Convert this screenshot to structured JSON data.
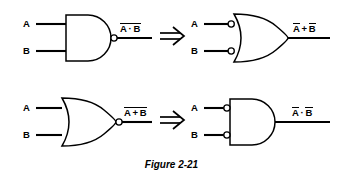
{
  "figure": {
    "caption": "Figure 2-21",
    "caption_style": "bold-italic",
    "background_color": "#ffffff",
    "ink_color": "#000000",
    "topic": "DeMorgan's theorems equivalent gate symbols"
  },
  "rows": [
    {
      "id": "row-top",
      "left_gate": {
        "type": "nand-gate",
        "shape": "and",
        "inputs": [
          {
            "name": "A",
            "label": "A",
            "bubble": false
          },
          {
            "name": "B",
            "label": "B",
            "bubble": false
          }
        ],
        "output_bubble": true,
        "output_label": {
          "text": "A · B",
          "operands": [
            "A",
            "B"
          ],
          "operator": "·",
          "overbar": "full"
        }
      },
      "equivalence_symbol": "⟹",
      "right_gate": {
        "type": "negative-input-or-gate",
        "shape": "or",
        "inputs": [
          {
            "name": "A",
            "label": "A",
            "bubble": true
          },
          {
            "name": "B",
            "label": "B",
            "bubble": true
          }
        ],
        "output_bubble": false,
        "output_label": {
          "text": "A + B",
          "operands": [
            "A",
            "B"
          ],
          "operator": "+",
          "overbar": "individual"
        }
      }
    },
    {
      "id": "row-bottom",
      "left_gate": {
        "type": "nor-gate",
        "shape": "or",
        "inputs": [
          {
            "name": "A",
            "label": "A",
            "bubble": false
          },
          {
            "name": "B",
            "label": "B",
            "bubble": false
          }
        ],
        "output_bubble": true,
        "output_label": {
          "text": "A + B",
          "operands": [
            "A",
            "B"
          ],
          "operator": "+",
          "overbar": "full"
        }
      },
      "equivalence_symbol": "⟹",
      "right_gate": {
        "type": "negative-input-and-gate",
        "shape": "and",
        "inputs": [
          {
            "name": "A",
            "label": "A",
            "bubble": true
          },
          {
            "name": "B",
            "label": "B",
            "bubble": true
          }
        ],
        "output_bubble": false,
        "output_label": {
          "text": "A · B",
          "operands": [
            "A",
            "B"
          ],
          "operator": "·",
          "overbar": "individual"
        }
      }
    }
  ],
  "labels": {
    "A": "A",
    "B": "B",
    "dot": "·",
    "plus": "+"
  }
}
